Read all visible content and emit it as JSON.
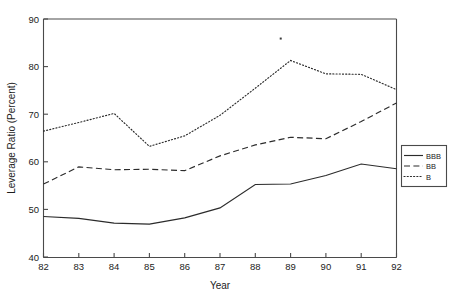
{
  "chart_data": {
    "type": "line",
    "title": "",
    "xlabel": "Year",
    "ylabel": "Leverage Ratio (Percent)",
    "x": [
      82,
      83,
      84,
      85,
      86,
      87,
      88,
      89,
      90,
      91,
      92
    ],
    "xtick_labels": [
      "82",
      "83",
      "84",
      "85",
      "86",
      "87",
      "88",
      "89",
      "90",
      "91",
      "92"
    ],
    "ytick_labels": [
      "40",
      "50",
      "60",
      "70",
      "80",
      "90"
    ],
    "yticks": [
      40,
      50,
      60,
      70,
      80,
      90
    ],
    "xlim": [
      82,
      92
    ],
    "ylim": [
      40,
      90
    ],
    "grid": false,
    "legend_position": "right-outside",
    "series": [
      {
        "name": "BBB",
        "style": "solid",
        "color": "#2b2b2b",
        "values": [
          48.6,
          48.2,
          47.2,
          47.0,
          48.3,
          50.4,
          55.3,
          55.4,
          57.2,
          59.6,
          58.6
        ]
      },
      {
        "name": "BB",
        "style": "dashed",
        "color": "#2b2b2b",
        "values": [
          55.4,
          59.0,
          58.4,
          58.5,
          58.2,
          61.3,
          63.6,
          65.2,
          64.9,
          68.5,
          72.4
        ]
      },
      {
        "name": "B",
        "style": "dotted",
        "color": "#2b2b2b",
        "values": [
          66.5,
          68.3,
          70.2,
          63.3,
          65.5,
          69.8,
          75.5,
          81.3,
          78.5,
          78.4,
          75.2
        ]
      }
    ],
    "annotations": [
      {
        "kind": "speck",
        "description": "stray scan artifact dot",
        "x": 88.72,
        "y": 85.9
      }
    ]
  },
  "legend": {
    "entries": [
      {
        "label": "BBB"
      },
      {
        "label": "BB"
      },
      {
        "label": "B"
      }
    ]
  },
  "axes": {
    "x_title": "Year",
    "y_title": "Leverage Ratio (Percent)"
  }
}
